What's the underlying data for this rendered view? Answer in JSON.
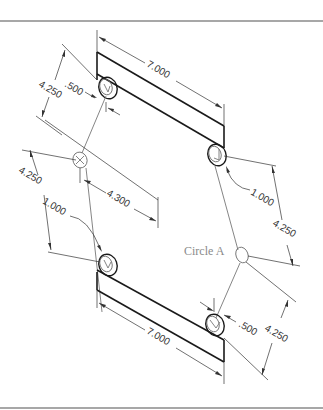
{
  "drawing": {
    "type": "isometric dimensioned drawing",
    "callout_label": "Circle A",
    "dimensions": {
      "top_bar_length": "7.000",
      "bottom_bar_length": "7.000",
      "top_left_offset": ".500",
      "top_left_spacing": "4.250",
      "left_spacing": "4.250",
      "left_hole_diameter": "1.000",
      "middle_offset": "4.300",
      "right_hole_diameter": "1.000",
      "right_spacing": "4.250",
      "bottom_right_offset": ".500",
      "bottom_right_spacing": "4.250"
    },
    "colors": {
      "part_lines": "#1a1a1a",
      "dimension_lines": "#333333",
      "label_text": "#8a8a8a",
      "frame_lines": "#8a8a8a"
    }
  }
}
